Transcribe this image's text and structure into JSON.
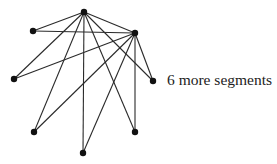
{
  "diagram": {
    "type": "graph",
    "caption": "6 more segments",
    "colors": {
      "edge": "#2a2a2a",
      "node": "#111111",
      "text": "#222222",
      "background": "#ffffff"
    },
    "nodes": [
      {
        "id": "top",
        "x": 84,
        "y": 12
      },
      {
        "id": "upper-left",
        "x": 33,
        "y": 31
      },
      {
        "id": "upper-right",
        "x": 135,
        "y": 33
      },
      {
        "id": "middle-left",
        "x": 14,
        "y": 79
      },
      {
        "id": "middle-right",
        "x": 153,
        "y": 81
      },
      {
        "id": "lower-left",
        "x": 34,
        "y": 132
      },
      {
        "id": "lower-right",
        "x": 135,
        "y": 132
      },
      {
        "id": "bottom",
        "x": 83,
        "y": 153
      }
    ],
    "edges": [
      [
        "top",
        "upper-left"
      ],
      [
        "top",
        "upper-right"
      ],
      [
        "top",
        "middle-left"
      ],
      [
        "top",
        "lower-left"
      ],
      [
        "top",
        "bottom"
      ],
      [
        "top",
        "lower-right"
      ],
      [
        "top",
        "middle-right"
      ],
      [
        "upper-left",
        "upper-right"
      ],
      [
        "upper-right",
        "middle-left"
      ],
      [
        "upper-right",
        "lower-left"
      ],
      [
        "upper-right",
        "bottom"
      ],
      [
        "upper-right",
        "lower-right"
      ],
      [
        "upper-right",
        "middle-right"
      ]
    ]
  }
}
